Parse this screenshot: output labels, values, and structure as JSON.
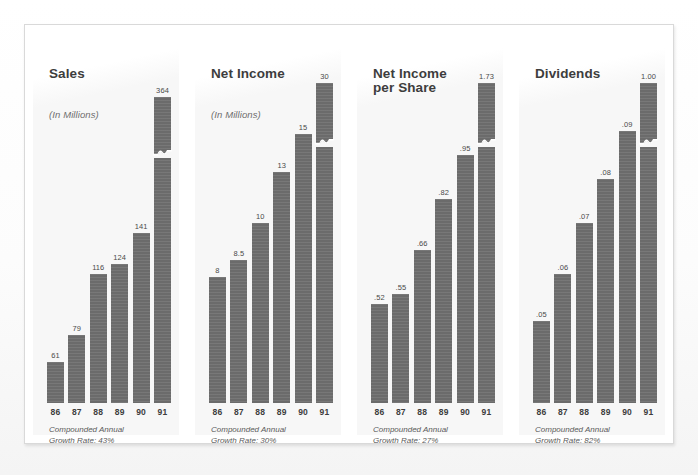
{
  "document": {
    "kind": "annual-report-bar-chart-page",
    "frame_border_color": "#d9d9d9",
    "panel_background_color": "#f7f7f7",
    "bar_color": "#6b6b6b",
    "text_color": "#3d3d3d"
  },
  "years": [
    "86",
    "87",
    "88",
    "89",
    "90",
    "91"
  ],
  "panels": [
    {
      "title": "Sales",
      "subtitle": "(In Millions)",
      "footnote": "Compounded Annual\nGrowth Rate: 43%",
      "growth_rate": "43%",
      "labels": [
        "61",
        "79",
        "116",
        "124",
        "141",
        "364"
      ]
    },
    {
      "title": "Net Income",
      "subtitle": "(In Millions)",
      "footnote": "Compounded Annual\nGrowth Rate: 30%",
      "growth_rate": "30%",
      "labels": [
        "8",
        "8.5",
        "10",
        "13",
        "15",
        "30"
      ]
    },
    {
      "title": "Net Income\nper Share",
      "subtitle": "",
      "footnote": "Compounded Annual\nGrowth Rate: 27%",
      "growth_rate": "27%",
      "labels": [
        ".52",
        ".55",
        ".66",
        ".82",
        ".95",
        "1.73"
      ]
    },
    {
      "title": "Dividends",
      "subtitle": "",
      "footnote": "Compounded Annual\nGrowth Rate: 82%",
      "growth_rate": "82%",
      "labels": [
        ".05",
        ".06",
        ".07",
        ".08",
        ".09",
        "1.00"
      ]
    }
  ],
  "chart_data": [
    {
      "type": "bar",
      "title": "Sales",
      "subtitle": "(In Millions)",
      "xlabel": "",
      "ylabel": "Millions of dollars",
      "categories": [
        "86",
        "87",
        "88",
        "89",
        "90",
        "91"
      ],
      "values": [
        61,
        79,
        116,
        124,
        141,
        364
      ],
      "value_labels": [
        "61",
        "79",
        "116",
        "124",
        "141",
        "364"
      ],
      "bar_pixel_fractions": [
        0.12,
        0.2,
        0.38,
        0.41,
        0.5,
        0.9
      ],
      "axis_break_on_last_bar": true,
      "annotation": "Compounded Annual Growth Rate: 43%",
      "grid": false,
      "legend": "none"
    },
    {
      "type": "bar",
      "title": "Net Income",
      "subtitle": "(In Millions)",
      "xlabel": "",
      "ylabel": "Millions of dollars",
      "categories": [
        "86",
        "87",
        "88",
        "89",
        "90",
        "91"
      ],
      "values": [
        8,
        8.5,
        10,
        13,
        15,
        30
      ],
      "value_labels": [
        "8",
        "8.5",
        "10",
        "13",
        "15",
        "30"
      ],
      "bar_pixel_fractions": [
        0.37,
        0.42,
        0.53,
        0.68,
        0.79,
        0.94
      ],
      "axis_break_on_last_bar": true,
      "annotation": "Compounded Annual Growth Rate: 30%",
      "grid": false,
      "legend": "none"
    },
    {
      "type": "bar",
      "title": "Net Income per Share",
      "subtitle": "",
      "xlabel": "",
      "ylabel": "Dollars per share",
      "categories": [
        "86",
        "87",
        "88",
        "89",
        "90",
        "91"
      ],
      "values": [
        0.52,
        0.55,
        0.66,
        0.82,
        0.95,
        1.73
      ],
      "value_labels": [
        ".52",
        ".55",
        ".66",
        ".82",
        ".95",
        "1.73"
      ],
      "bar_pixel_fractions": [
        0.29,
        0.32,
        0.45,
        0.6,
        0.73,
        0.94
      ],
      "axis_break_on_last_bar": true,
      "annotation": "Compounded Annual Growth Rate: 27%",
      "grid": false,
      "legend": "none"
    },
    {
      "type": "bar",
      "title": "Dividends",
      "subtitle": "",
      "xlabel": "",
      "ylabel": "Dollars per share",
      "categories": [
        "86",
        "87",
        "88",
        "89",
        "90",
        "91"
      ],
      "values": [
        0.05,
        0.06,
        0.07,
        0.08,
        0.09,
        1.0
      ],
      "value_labels": [
        ".05",
        ".06",
        ".07",
        ".08",
        ".09",
        "1.00"
      ],
      "bar_pixel_fractions": [
        0.24,
        0.38,
        0.53,
        0.66,
        0.8,
        0.94
      ],
      "axis_break_on_last_bar": true,
      "annotation": "Compounded Annual Growth Rate: 82%",
      "grid": false,
      "legend": "none"
    }
  ]
}
